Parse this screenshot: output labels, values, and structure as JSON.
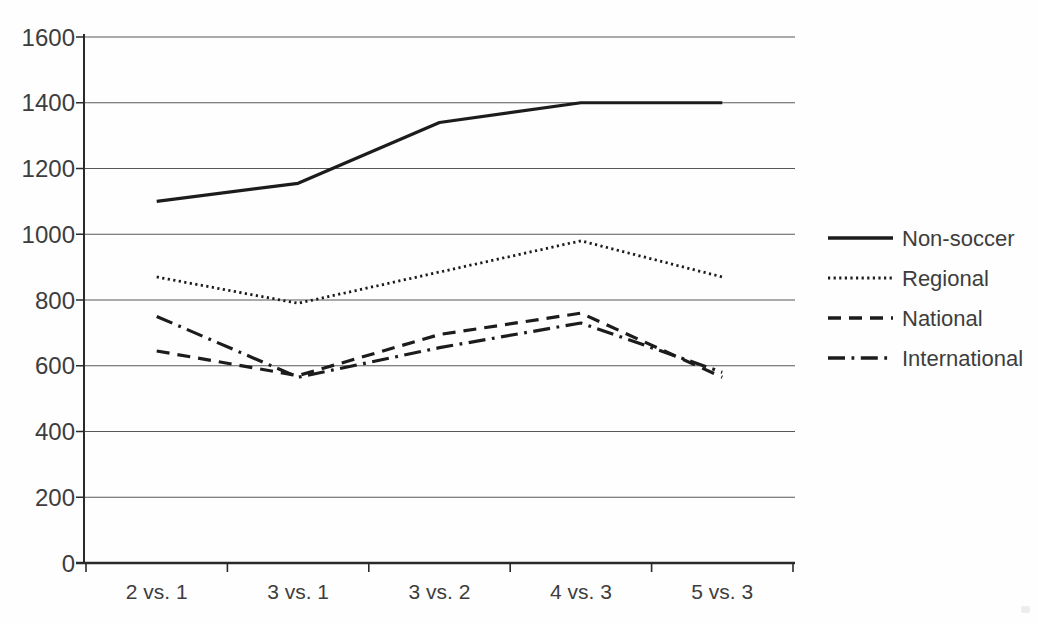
{
  "chart_data": {
    "type": "line",
    "title": "",
    "xlabel": "",
    "ylabel": "",
    "grid": true,
    "legend_position": "right",
    "categories": [
      "2 vs. 1",
      "3 vs. 1",
      "3 vs. 2",
      "4 vs. 3",
      "5 vs. 3"
    ],
    "series": [
      {
        "name": "Non-soccer",
        "style": "solid",
        "values": [
          1100,
          1155,
          1340,
          1400,
          1400
        ]
      },
      {
        "name": "Regional",
        "style": "dotted",
        "values": [
          870,
          790,
          885,
          980,
          870
        ]
      },
      {
        "name": "National",
        "style": "dashed",
        "values": [
          645,
          570,
          695,
          760,
          565
        ]
      },
      {
        "name": "International",
        "style": "dashdot",
        "values": [
          750,
          565,
          655,
          730,
          580
        ]
      }
    ],
    "y_axis": {
      "min": 0,
      "max": 1600,
      "step": 200,
      "tick_labels": [
        "0",
        "200",
        "400",
        "600",
        "800",
        "1000",
        "1200",
        "1400",
        "1600"
      ]
    },
    "colors": {
      "line": "#1c1c1c",
      "grid": "#585858",
      "axis": "#2a2a2a",
      "text": "#3d3d3d",
      "background": "#fefefe"
    }
  }
}
